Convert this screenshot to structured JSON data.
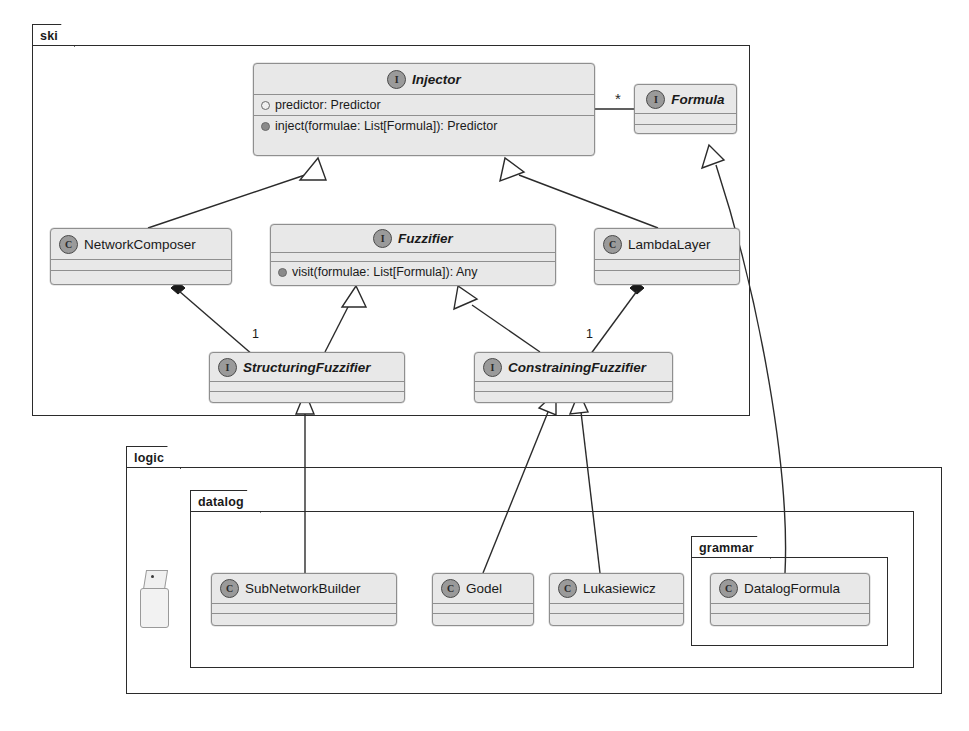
{
  "diagram": {
    "kind": "uml-class-diagram",
    "packages": [
      {
        "id": "ski",
        "label": "ski"
      },
      {
        "id": "logic",
        "label": "logic"
      },
      {
        "id": "datalog",
        "label": "datalog"
      },
      {
        "id": "grammar",
        "label": "grammar"
      }
    ],
    "nodes": [
      {
        "id": "injector",
        "name": "Injector",
        "kind": "interface",
        "stereotype": "I",
        "package": "ski",
        "attributes": [
          {
            "visibility": "hollow",
            "text": "predictor: Predictor"
          }
        ],
        "operations": [
          {
            "visibility": "filled",
            "text": "inject(formulae: List[Formula]): Predictor"
          }
        ]
      },
      {
        "id": "formula",
        "name": "Formula",
        "kind": "interface",
        "stereotype": "I",
        "package": "ski",
        "attributes": [],
        "operations": []
      },
      {
        "id": "networkcomposer",
        "name": "NetworkComposer",
        "kind": "class",
        "stereotype": "C",
        "package": "ski",
        "attributes": [],
        "operations": []
      },
      {
        "id": "fuzzifier",
        "name": "Fuzzifier",
        "kind": "interface",
        "stereotype": "I",
        "package": "ski",
        "attributes": [],
        "operations": [
          {
            "visibility": "filled",
            "text": "visit(formulae: List[Formula]): Any"
          }
        ]
      },
      {
        "id": "lambdalayer",
        "name": "LambdaLayer",
        "kind": "class",
        "stereotype": "C",
        "package": "ski",
        "attributes": [],
        "operations": []
      },
      {
        "id": "structuringfuzzifier",
        "name": "StructuringFuzzifier",
        "kind": "interface",
        "stereotype": "I",
        "package": "ski",
        "attributes": [],
        "operations": []
      },
      {
        "id": "constrainingfuzzifier",
        "name": "ConstrainingFuzzifier",
        "kind": "interface",
        "stereotype": "I",
        "package": "ski",
        "attributes": [],
        "operations": []
      },
      {
        "id": "subnetworkbuilder",
        "name": "SubNetworkBuilder",
        "kind": "class",
        "stereotype": "C",
        "package": "datalog",
        "attributes": [],
        "operations": []
      },
      {
        "id": "godel",
        "name": "Godel",
        "kind": "class",
        "stereotype": "C",
        "package": "datalog",
        "attributes": [],
        "operations": []
      },
      {
        "id": "lukasiewicz",
        "name": "Lukasiewicz",
        "kind": "class",
        "stereotype": "C",
        "package": "datalog",
        "attributes": [],
        "operations": []
      },
      {
        "id": "datalogformula",
        "name": "DatalogFormula",
        "kind": "class",
        "stereotype": "C",
        "package": "grammar",
        "attributes": [],
        "operations": []
      }
    ],
    "edges": [
      {
        "from": "networkcomposer",
        "to": "injector",
        "type": "generalization",
        "label": ""
      },
      {
        "from": "lambdalayer",
        "to": "injector",
        "type": "generalization",
        "label": ""
      },
      {
        "from": "injector",
        "to": "formula",
        "type": "association",
        "label": "*"
      },
      {
        "from": "structuringfuzzifier",
        "to": "fuzzifier",
        "type": "generalization",
        "label": ""
      },
      {
        "from": "constrainingfuzzifier",
        "to": "fuzzifier",
        "type": "generalization",
        "label": ""
      },
      {
        "from": "networkcomposer",
        "to": "structuringfuzzifier",
        "type": "composition",
        "label": "1"
      },
      {
        "from": "lambdalayer",
        "to": "constrainingfuzzifier",
        "type": "composition",
        "label": "1"
      },
      {
        "from": "subnetworkbuilder",
        "to": "structuringfuzzifier",
        "type": "generalization",
        "label": ""
      },
      {
        "from": "godel",
        "to": "constrainingfuzzifier",
        "type": "generalization",
        "label": ""
      },
      {
        "from": "lukasiewicz",
        "to": "constrainingfuzzifier",
        "type": "generalization",
        "label": ""
      },
      {
        "from": "datalogformula",
        "to": "formula",
        "type": "generalization",
        "label": ""
      }
    ],
    "annotations": [
      {
        "id": "scrap-note",
        "label": "*"
      }
    ]
  }
}
